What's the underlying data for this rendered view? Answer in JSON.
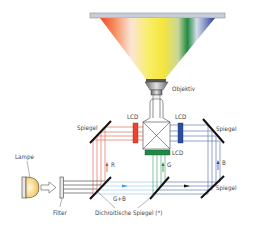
{
  "diagram": {
    "type": "3LCD projector optical path",
    "labels": {
      "objective": "Objektiv",
      "lcd_red": "LCD",
      "lcd_blue": "LCD",
      "lcd_green": "LCD",
      "mirror_left": "Spiegel",
      "mirror_right_top": "Spiegel",
      "mirror_right_bottom": "Spiegel",
      "lamp": "Lampe",
      "filter": "Filter",
      "gb": "G+B",
      "r": "R",
      "g": "G",
      "b": "B",
      "dichroic": "Dichroitische Spiegel (*)"
    },
    "colors": {
      "red": "#e8452c",
      "green": "#1e8a45",
      "blue": "#2a4fa0",
      "light_blue": "#8fc8ea",
      "yellow": "#f7e84a",
      "mirror": "#111111",
      "screen": "#c8cdd8",
      "line_gray": "#555555"
    }
  }
}
